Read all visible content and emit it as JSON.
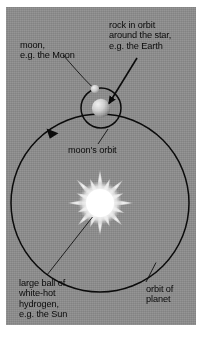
{
  "figure": {
    "type": "astronomy-diagram",
    "background_color": "#8c8c8c",
    "ink_color": "#0a0a0a",
    "border_color": "#ffffff"
  },
  "labels": {
    "moon": "moon,\ne.g. the Moon",
    "planet": "rock in orbit\naround the star,\ne.g. the Earth",
    "moon_orbit": "moon's orbit",
    "sun": "large ball of\nwhite-hot\nhydrogen,\ne.g. the Sun",
    "planet_orbit": "orbit of\nplanet"
  },
  "bodies": [
    {
      "name": "sun",
      "label_key": "sun",
      "kind": "star",
      "color": "#ffffff",
      "cx": 94,
      "cy": 196,
      "r": 15,
      "rays": 16
    },
    {
      "name": "planet",
      "label_key": "planet",
      "kind": "planet",
      "color": "#d8d8d8",
      "cx": 95,
      "cy": 101,
      "r": 9
    },
    {
      "name": "moon",
      "label_key": "moon",
      "kind": "moon",
      "color": "#d8d8d8",
      "cx": 89,
      "cy": 82,
      "r": 4
    }
  ],
  "orbits": [
    {
      "name": "moon-orbit",
      "label_key": "moon_orbit",
      "cx": 95,
      "cy": 101,
      "r": 20,
      "stroke_width": 1.4,
      "arrow": false
    },
    {
      "name": "planet-orbit",
      "label_key": "planet_orbit",
      "cx": 94,
      "cy": 196,
      "r": 89,
      "stroke_width": 1.4,
      "arrow": true,
      "arrow_direction": "clockwise"
    }
  ],
  "leaders": [
    {
      "name": "moon-leader",
      "style": "thin",
      "arrowhead": false
    },
    {
      "name": "planet-leader",
      "style": "thick",
      "arrowhead": true
    },
    {
      "name": "moon-orbit-leader",
      "style": "thin",
      "arrowhead": false
    },
    {
      "name": "sun-leader",
      "style": "thin",
      "arrowhead": false
    },
    {
      "name": "planet-orbit-leader",
      "style": "thin",
      "arrowhead": false
    }
  ]
}
